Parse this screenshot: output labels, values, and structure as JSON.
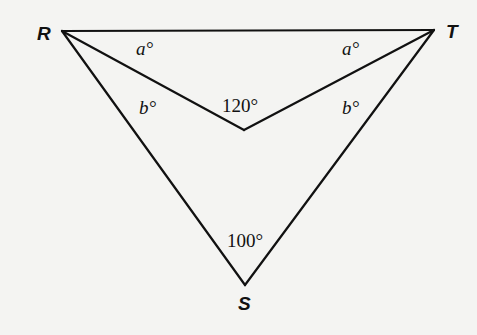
{
  "diagram": {
    "type": "geometry-figure",
    "points": {
      "R": {
        "label": "R",
        "x": 62,
        "y": 31
      },
      "T": {
        "label": "T",
        "x": 434,
        "y": 30
      },
      "S": {
        "label": "S",
        "x": 245,
        "y": 285
      },
      "P": {
        "label": "",
        "x": 244,
        "y": 130
      }
    },
    "segments": [
      [
        "R",
        "T"
      ],
      [
        "R",
        "S"
      ],
      [
        "T",
        "S"
      ],
      [
        "R",
        "P"
      ],
      [
        "T",
        "P"
      ]
    ],
    "angle_labels": {
      "RT_left_a": "a°",
      "RT_right_a": "a°",
      "left_b": "b°",
      "right_b": "b°",
      "inner": "120°",
      "bottom": "100°"
    },
    "vertex_labels": {
      "R": "R",
      "T": "T",
      "S": "S"
    }
  }
}
